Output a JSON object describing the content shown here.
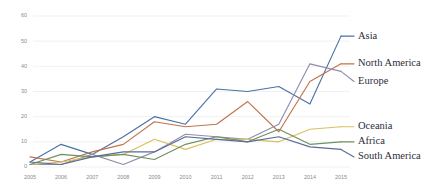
{
  "chart_data": {
    "type": "line",
    "title": "",
    "xlabel": "",
    "ylabel": "",
    "categories": [
      "2005",
      "2006",
      "2007",
      "2008",
      "2009",
      "2010",
      "2011",
      "2012",
      "2013",
      "2014",
      "2015"
    ],
    "x": [
      2005,
      2006,
      2007,
      2008,
      2009,
      2010,
      2011,
      2012,
      2013,
      2014,
      2015
    ],
    "ylim": [
      0,
      60
    ],
    "ytick_labels": [
      "0",
      "10",
      "20",
      "30",
      "40",
      "50",
      "60"
    ],
    "ytick_values": [
      0,
      10,
      20,
      30,
      40,
      50,
      60
    ],
    "grid": "horizontal",
    "legend_position": "right-inline",
    "background": "#ffffff",
    "series": [
      {
        "name": "Asia",
        "color": "#4a72a8",
        "values": [
          2,
          9,
          5,
          12,
          20,
          17,
          31,
          30,
          32,
          25,
          52
        ],
        "label_y": 52
      },
      {
        "name": "North America",
        "color": "#c0744a",
        "values": [
          4,
          2,
          6,
          9,
          18,
          16,
          17,
          26,
          14,
          34,
          41
        ],
        "label_y": 41
      },
      {
        "name": "Europe",
        "color": "#8e8fae",
        "values": [
          1,
          1,
          5,
          1,
          6,
          13,
          12,
          11,
          17,
          41,
          38
        ],
        "label_y": 34
      },
      {
        "name": "Oceania",
        "color": "#d8c15e",
        "values": [
          1,
          2,
          4,
          5,
          11,
          7,
          11,
          11,
          10,
          15,
          16
        ],
        "label_y": 16
      },
      {
        "name": "Africa",
        "color": "#6f9060",
        "values": [
          1,
          5,
          4,
          5,
          3,
          9,
          12,
          10,
          15,
          9,
          10
        ],
        "label_y": 10
      },
      {
        "name": "South America",
        "color": "#5b6b96",
        "values": [
          2,
          1,
          4,
          6,
          6,
          12,
          11,
          10,
          12,
          8,
          7
        ],
        "label_y": 4
      }
    ]
  },
  "axes": {
    "y_labels": [
      "60",
      "50",
      "40",
      "30",
      "20",
      "10",
      "0"
    ],
    "x_labels": [
      "2005",
      "2006",
      "2007",
      "2008",
      "2009",
      "2010",
      "2011",
      "2012",
      "2013",
      "2014",
      "2015"
    ]
  },
  "legend": {
    "items": [
      {
        "label": "Asia"
      },
      {
        "label": "North America"
      },
      {
        "label": "Europe"
      },
      {
        "label": "Oceania"
      },
      {
        "label": "Africa"
      },
      {
        "label": "South America"
      }
    ]
  }
}
